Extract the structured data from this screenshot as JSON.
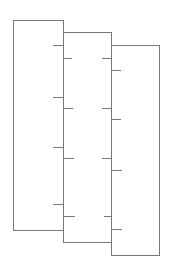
{
  "diagram": {
    "type": "overlapping-panels-with-ticks",
    "stroke_color": "#777777",
    "background": "#ffffff",
    "panels": [
      {
        "name": "left-panel",
        "x": 13,
        "y": 20,
        "w": 50,
        "h": 210,
        "ticks": [
          {
            "side": "right-inner",
            "y": 45,
            "x1": 53,
            "x2": 63
          },
          {
            "side": "right-inner",
            "y": 97,
            "x1": 53,
            "x2": 63
          },
          {
            "side": "right-inner",
            "y": 147,
            "x1": 53,
            "x2": 63
          },
          {
            "side": "right-inner",
            "y": 204,
            "x1": 53,
            "x2": 63
          }
        ]
      },
      {
        "name": "middle-panel",
        "x": 63,
        "y": 32,
        "w": 48,
        "h": 210,
        "ticks": [
          {
            "side": "left-inner",
            "y": 58,
            "x1": 63,
            "x2": 72
          },
          {
            "side": "left-inner",
            "y": 108,
            "x1": 63,
            "x2": 73
          },
          {
            "side": "left-inner",
            "y": 158,
            "x1": 63,
            "x2": 74
          },
          {
            "side": "left-inner",
            "y": 216,
            "x1": 63,
            "x2": 75
          },
          {
            "side": "right-inner",
            "y": 58,
            "x1": 102,
            "x2": 111
          },
          {
            "side": "right-inner",
            "y": 108,
            "x1": 102,
            "x2": 111
          },
          {
            "side": "right-inner",
            "y": 158,
            "x1": 102,
            "x2": 111
          },
          {
            "side": "right-inner",
            "y": 216,
            "x1": 104,
            "x2": 111
          }
        ]
      },
      {
        "name": "right-panel",
        "x": 111,
        "y": 45,
        "w": 48,
        "h": 210,
        "ticks": [
          {
            "side": "left-inner",
            "y": 70,
            "x1": 111,
            "x2": 121
          },
          {
            "side": "left-inner",
            "y": 119,
            "x1": 111,
            "x2": 121
          },
          {
            "side": "left-inner",
            "y": 170,
            "x1": 112,
            "x2": 122
          },
          {
            "side": "left-inner",
            "y": 229,
            "x1": 111,
            "x2": 122
          }
        ]
      }
    ]
  }
}
